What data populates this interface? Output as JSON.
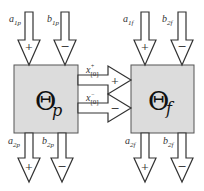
{
  "diagram": {
    "blocks": [
      {
        "id": "theta-p",
        "symbol": "Θ",
        "subscript": "p"
      },
      {
        "id": "theta-f",
        "symbol": "Θ",
        "subscript": "f"
      }
    ],
    "inputs_p": [
      {
        "label": "a",
        "sub": "1p",
        "sign": "+"
      },
      {
        "label": "b",
        "sub": "1p",
        "sign": "−"
      }
    ],
    "outputs_p": [
      {
        "label": "a",
        "sub": "2p",
        "sign": "+"
      },
      {
        "label": "b",
        "sub": "2p",
        "sign": "−"
      }
    ],
    "inputs_f": [
      {
        "label": "a",
        "sub": "1f",
        "sign": "+"
      },
      {
        "label": "b",
        "sub": "2f",
        "sign": "−"
      }
    ],
    "outputs_f": [
      {
        "label": "a",
        "sub": "2f",
        "sign": "+"
      },
      {
        "label": "b",
        "sub": "2f",
        "sign": "−"
      }
    ],
    "connections": [
      {
        "label": "x",
        "sup": "+",
        "sub": "[0]",
        "sign": "+"
      },
      {
        "label": "x",
        "sup": "−",
        "sub": "[0]",
        "sign": "−"
      }
    ],
    "colors": {
      "block_fill": "#dcdcdc",
      "stroke": "#333333",
      "arrow_fill": "#ffffff"
    }
  }
}
